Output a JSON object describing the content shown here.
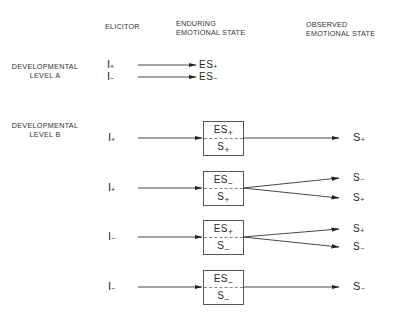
{
  "headers": {
    "elicitor": "ELICITOR",
    "enduring_line1": "ENDURING",
    "enduring_line2": "EMOTIONAL STATE",
    "observed_line1": "OBSERVED",
    "observed_line2": "EMOTIONAL STATE"
  },
  "levels": {
    "a_line1": "DEVELOPMENTAL",
    "a_line2": "LEVEL A",
    "b_line1": "DEVELOPMENTAL",
    "b_line2": "LEVEL B"
  },
  "level_a": {
    "rows": [
      {
        "elicitor": "I",
        "elicitor_sign": "+",
        "state": "ES",
        "state_sign": "+"
      },
      {
        "elicitor": "I",
        "elicitor_sign": "−",
        "state": "ES",
        "state_sign": "−"
      }
    ]
  },
  "level_b": {
    "rows": [
      {
        "elicitor": "I",
        "elicitor_sign": "+",
        "box_top": "ES",
        "box_top_sign": "+",
        "box_bottom": "S",
        "box_bottom_sign": "+",
        "outputs": [
          {
            "label": "S",
            "sign": "+"
          }
        ]
      },
      {
        "elicitor": "I",
        "elicitor_sign": "+",
        "box_top": "ES",
        "box_top_sign": "−",
        "box_bottom": "S",
        "box_bottom_sign": "+",
        "outputs": [
          {
            "label": "S",
            "sign": "−"
          },
          {
            "label": "S",
            "sign": "+"
          }
        ]
      },
      {
        "elicitor": "I",
        "elicitor_sign": "−",
        "box_top": "ES",
        "box_top_sign": "+",
        "box_bottom": "S",
        "box_bottom_sign": "−",
        "outputs": [
          {
            "label": "S",
            "sign": "+"
          },
          {
            "label": "S",
            "sign": "−"
          }
        ]
      },
      {
        "elicitor": "I",
        "elicitor_sign": "−",
        "box_top": "ES",
        "box_top_sign": "−",
        "box_bottom": "S",
        "box_bottom_sign": "−",
        "outputs": [
          {
            "label": "S",
            "sign": "−"
          }
        ]
      }
    ]
  }
}
